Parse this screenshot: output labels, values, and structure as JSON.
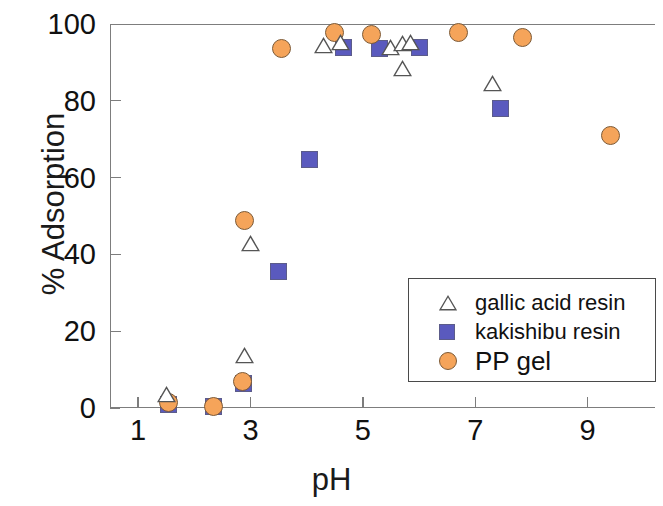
{
  "chart_data": {
    "type": "scatter",
    "title": "",
    "xlabel": "pH",
    "ylabel": "% Adsorption",
    "xlim": [
      0.5,
      10.2
    ],
    "ylim": [
      0,
      100
    ],
    "xticks": [
      1,
      3,
      5,
      7,
      9
    ],
    "yticks": [
      0,
      20,
      40,
      60,
      80,
      100
    ],
    "grid": false,
    "legend_position": "center-right",
    "series": [
      {
        "name": "gallic acid resin",
        "marker": "triangle",
        "color": "#ffffff",
        "edge_color": "#555555",
        "points": [
          {
            "x": 1.5,
            "y": 3.6
          },
          {
            "x": 2.9,
            "y": 13.8
          },
          {
            "x": 3.0,
            "y": 42.8
          },
          {
            "x": 4.3,
            "y": 94.3
          },
          {
            "x": 4.6,
            "y": 95.3
          },
          {
            "x": 5.5,
            "y": 94.0
          },
          {
            "x": 5.7,
            "y": 95.0
          },
          {
            "x": 5.85,
            "y": 95.3
          },
          {
            "x": 5.7,
            "y": 88.5
          },
          {
            "x": 7.3,
            "y": 84.4
          }
        ]
      },
      {
        "name": "kakishibu resin",
        "marker": "square",
        "color": "#5A5ABE",
        "edge_color": "#5c5c8a",
        "points": [
          {
            "x": 1.55,
            "y": 1.0
          },
          {
            "x": 2.35,
            "y": 0.5
          },
          {
            "x": 2.87,
            "y": 6.5
          },
          {
            "x": 3.5,
            "y": 35.5
          },
          {
            "x": 4.05,
            "y": 64.8
          },
          {
            "x": 4.65,
            "y": 93.8
          },
          {
            "x": 5.3,
            "y": 93.5
          },
          {
            "x": 6.0,
            "y": 93.8
          },
          {
            "x": 7.45,
            "y": 78.0
          }
        ]
      },
      {
        "name": "PP gel",
        "marker": "circle",
        "color": "#F5A45A",
        "edge_color": "#7d5a36",
        "points": [
          {
            "x": 1.55,
            "y": 1.5
          },
          {
            "x": 2.35,
            "y": 0.3
          },
          {
            "x": 2.85,
            "y": 7.0
          },
          {
            "x": 2.9,
            "y": 48.8
          },
          {
            "x": 3.55,
            "y": 93.5
          },
          {
            "x": 4.5,
            "y": 97.7
          },
          {
            "x": 5.15,
            "y": 97.3
          },
          {
            "x": 6.7,
            "y": 97.8
          },
          {
            "x": 7.85,
            "y": 96.4
          },
          {
            "x": 9.4,
            "y": 71.0
          }
        ]
      }
    ]
  },
  "legend": {
    "entries": [
      {
        "label": "gallic acid resin",
        "marker": "triangle",
        "font_size": 22
      },
      {
        "label": "kakishibu resin",
        "marker": "square",
        "font_size": 22
      },
      {
        "label": "PP gel",
        "marker": "circle",
        "font_size": 26
      }
    ]
  },
  "axes": {
    "y_tick_labels": [
      "100",
      "80",
      "60",
      "40",
      "20",
      "0"
    ],
    "x_tick_labels": [
      "1",
      "3",
      "5",
      "7",
      "9"
    ]
  },
  "colors": {
    "circle_fill": "#F5A45A",
    "circle_edge": "#7d5a36",
    "square_fill": "#5A5ABE",
    "square_edge": "#5c5c8a",
    "triangle_edge": "#555555",
    "axis": "#7d7d7d",
    "text": "#111111"
  }
}
